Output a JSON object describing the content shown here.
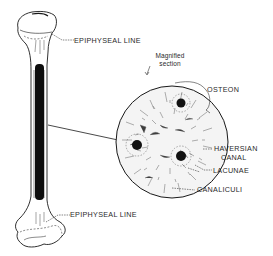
{
  "diagram": {
    "title": "",
    "labels": {
      "epiphyseal_top": "EPIPHYSEAL LINE",
      "epiphyseal_bottom": "EPIPHYSEAL LINE",
      "magnified_line1": "Magnified",
      "magnified_line2": "section",
      "osteon": "OSTEON",
      "haversian_line1": "HAVERSIAN",
      "haversian_line2": "CANAL",
      "lacunae": "LACUNAE",
      "canaliculi": "CANALICULI"
    },
    "colors": {
      "ink": "#1a1a1a",
      "marrow": "#0d0d0d",
      "background": "#ffffff"
    }
  }
}
